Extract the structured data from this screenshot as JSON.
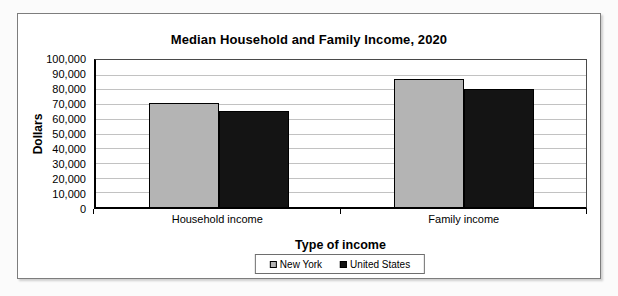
{
  "chart_data": {
    "type": "bar",
    "title": "Median Household and Family Income, 2020",
    "xlabel": "Type of income",
    "ylabel": "Dollars",
    "categories": [
      "Household income",
      "Family income"
    ],
    "series": [
      {
        "name": "New York",
        "color": "#b4b4b4",
        "values": [
          71000,
          87000
        ]
      },
      {
        "name": "United States",
        "color": "#141414",
        "values": [
          65000,
          80500
        ]
      }
    ],
    "ylim": [
      0,
      100000
    ],
    "ytick_step": 10000,
    "ytick_labels": [
      "100,000",
      "90,000",
      "80,000",
      "70,000",
      "60,000",
      "50,000",
      "40,000",
      "30,000",
      "20,000",
      "10,000",
      "0"
    ],
    "grid": true,
    "legend_position": "bottom-center",
    "colors": {
      "gridline": "#c2c2c2",
      "plot_border": "#4a4a4a",
      "axis": "#000000",
      "frame_border": "#7d7d7d",
      "background": "#ffffff"
    }
  }
}
